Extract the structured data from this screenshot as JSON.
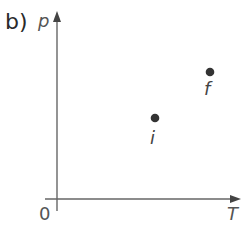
{
  "figure": {
    "part_label": "b)",
    "axes": {
      "y_label": "p",
      "x_label": "T",
      "origin_label": "0"
    },
    "points": [
      {
        "id": "i",
        "label": "i",
        "x_px": 155,
        "y_px": 118
      },
      {
        "id": "f",
        "label": "f",
        "x_px": 210,
        "y_px": 72
      }
    ],
    "colors": {
      "axis": "#555555",
      "point": "#333333",
      "text": "#444444"
    }
  }
}
